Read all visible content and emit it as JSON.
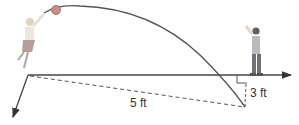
{
  "diagram": {
    "labels": {
      "hypotenuse": "5 ft",
      "vertical_leg": "3 ft"
    },
    "colors": {
      "line": "#444444",
      "ball": "#c98f86",
      "ball_stroke": "#8a6a66"
    },
    "elements": [
      "girl-jumping-figure",
      "ball",
      "ball-trajectory-arc",
      "horizontal-axis-arrow",
      "down-left-axis-arrow",
      "boy-standing-figure",
      "dashed-hypotenuse",
      "dashed-vertical-leg",
      "right-angle-marker"
    ]
  }
}
